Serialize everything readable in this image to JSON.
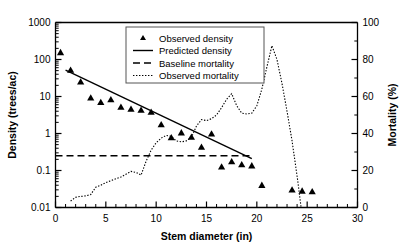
{
  "chart_data": {
    "type": "scatter",
    "title": "",
    "xlabel": "Stem diameter (in)",
    "ylabel": "Density (trees/ac)",
    "y2label": "Mortality (%)",
    "xlim": [
      0,
      30
    ],
    "xticks": [
      0,
      5,
      10,
      15,
      20,
      25,
      30
    ],
    "xtick_labels": [
      "0",
      "5",
      "10",
      "15",
      "20",
      "25",
      "30"
    ],
    "x_minor_step": 1,
    "ylim": [
      0.01,
      1000
    ],
    "yscale": "log",
    "yticks": [
      0.01,
      0.1,
      1,
      10,
      100,
      1000
    ],
    "ytick_labels": [
      "0.01",
      "0.1",
      "1",
      "10",
      "100",
      "1000"
    ],
    "y2lim": [
      0,
      100
    ],
    "y2ticks": [
      0,
      20,
      40,
      60,
      80,
      100
    ],
    "y2tick_labels": [
      "0",
      "20",
      "40",
      "60",
      "80",
      "100"
    ],
    "y2_minor_step": 10,
    "grid": false,
    "legend_position": "top-center",
    "legend_entries": [
      {
        "label": "Observed density",
        "marker": "triangle",
        "style": "marker"
      },
      {
        "label": "Predicted density",
        "marker": "none",
        "style": "solid"
      },
      {
        "label": "Baseline mortality",
        "marker": "none",
        "style": "dashed"
      },
      {
        "label": "Observed mortality",
        "marker": "none",
        "style": "dotted"
      }
    ],
    "series": [
      {
        "name": "Observed density",
        "axis": "left",
        "type": "scatter",
        "marker": "triangle",
        "points": [
          [
            0.5,
            155
          ],
          [
            1.5,
            52
          ],
          [
            2.5,
            25
          ],
          [
            3.5,
            9.2
          ],
          [
            4.5,
            7.0
          ],
          [
            5.5,
            8.3
          ],
          [
            6.5,
            5.2
          ],
          [
            7.5,
            4.6
          ],
          [
            8.5,
            4.3
          ],
          [
            9.5,
            3.8
          ],
          [
            10.5,
            1.75
          ],
          [
            11.5,
            0.78
          ],
          [
            12.5,
            1.05
          ],
          [
            13.5,
            0.8
          ],
          [
            14.5,
            0.43
          ],
          [
            15.5,
            0.98
          ],
          [
            16.5,
            0.125
          ],
          [
            17.5,
            0.175
          ],
          [
            18.5,
            0.145
          ],
          [
            19.5,
            0.135
          ],
          [
            20.5,
            0.04
          ],
          [
            23.5,
            0.03
          ],
          [
            24.5,
            0.028
          ],
          [
            25.5,
            0.027
          ]
        ]
      },
      {
        "name": "Predicted density",
        "axis": "left",
        "type": "line",
        "style": "solid",
        "points": [
          [
            1.0,
            52
          ],
          [
            19.5,
            0.21
          ]
        ]
      },
      {
        "name": "Baseline mortality",
        "axis": "left",
        "type": "line",
        "style": "dashed",
        "points": [
          [
            0.0,
            0.25
          ],
          [
            19.5,
            0.25
          ]
        ]
      },
      {
        "name": "Observed mortality",
        "axis": "right",
        "type": "line",
        "style": "dotted",
        "points": [
          [
            1.5,
            3.5
          ],
          [
            2.0,
            5.5
          ],
          [
            2.5,
            6.0
          ],
          [
            3.0,
            6.3
          ],
          [
            3.5,
            7.0
          ],
          [
            4.0,
            11.0
          ],
          [
            4.5,
            12.0
          ],
          [
            5.0,
            13.5
          ],
          [
            5.5,
            14.5
          ],
          [
            6.0,
            15.5
          ],
          [
            6.5,
            16.5
          ],
          [
            7.0,
            18.0
          ],
          [
            7.5,
            19.5
          ],
          [
            8.0,
            19.0
          ],
          [
            8.5,
            17.5
          ],
          [
            9.0,
            25.0
          ],
          [
            9.5,
            31.0
          ],
          [
            10.0,
            35.0
          ],
          [
            10.5,
            37.5
          ],
          [
            11.0,
            39.0
          ],
          [
            11.5,
            38.5
          ],
          [
            12.0,
            36.0
          ],
          [
            12.5,
            35.5
          ],
          [
            13.0,
            36.0
          ],
          [
            13.5,
            38.0
          ],
          [
            14.0,
            44.0
          ],
          [
            14.5,
            47.5
          ],
          [
            15.0,
            47.0
          ],
          [
            15.5,
            48.0
          ],
          [
            16.0,
            50.0
          ],
          [
            16.5,
            54.0
          ],
          [
            17.0,
            58.5
          ],
          [
            17.5,
            61.5
          ],
          [
            18.0,
            55.0
          ],
          [
            18.5,
            51.0
          ],
          [
            19.0,
            50.5
          ],
          [
            19.5,
            51.0
          ],
          [
            20.0,
            55.0
          ],
          [
            20.5,
            64.0
          ],
          [
            21.0,
            76.0
          ],
          [
            21.5,
            87.5
          ],
          [
            22.0,
            80.0
          ],
          [
            22.5,
            67.0
          ],
          [
            23.0,
            52.0
          ],
          [
            23.5,
            36.0
          ],
          [
            24.0,
            17.0
          ],
          [
            24.4,
            0.0
          ]
        ]
      }
    ]
  }
}
